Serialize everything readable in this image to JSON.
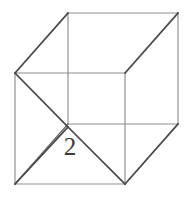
{
  "figure": {
    "name": "cube-with-diagonals",
    "type": "geometry-diagram",
    "shape_name": "cube",
    "projection": "oblique",
    "background_color": "#ffffff",
    "line_color_light": "#8e8e8e",
    "line_color_dark": "#4a4a4a",
    "label_color": "#3a3a3a"
  },
  "labels": {
    "edge_length": "2"
  },
  "geometry": {
    "back_face": {
      "top_left": [
        68,
        13
      ],
      "top_right": [
        178,
        13
      ],
      "bottom_right": [
        178,
        124
      ],
      "bottom_left": [
        68,
        124
      ]
    },
    "front_face": {
      "top_left": [
        15,
        73
      ],
      "top_right": [
        125,
        73
      ],
      "bottom_right": [
        125,
        184
      ],
      "bottom_left": [
        15,
        184
      ]
    },
    "connectors": [
      [
        [
          15,
          73
        ],
        [
          68,
          13
        ]
      ],
      [
        [
          125,
          73
        ],
        [
          178,
          13
        ]
      ],
      [
        [
          125,
          184
        ],
        [
          178,
          124
        ]
      ],
      [
        [
          15,
          184
        ],
        [
          68,
          124
        ]
      ]
    ],
    "diagonals": [
      [
        [
          15,
          73
        ],
        [
          68,
          127
        ]
      ],
      [
        [
          15,
          184
        ],
        [
          68,
          127
        ]
      ],
      [
        [
          68,
          127
        ],
        [
          125,
          184
        ]
      ]
    ],
    "label_position": [
      70,
      155
    ]
  }
}
